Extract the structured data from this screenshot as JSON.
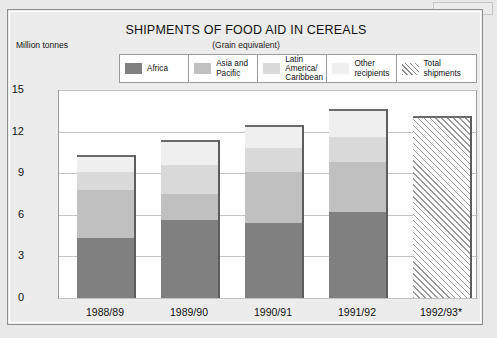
{
  "chart_data": {
    "type": "bar",
    "subtype": "stacked-bar-with-total",
    "title": "SHIPMENTS OF FOOD AID IN CEREALS",
    "subtitle": "(Grain equivalent)",
    "ylabel": "Million tonnes",
    "xlabel": "",
    "ylim": [
      0,
      15
    ],
    "yticks": [
      0,
      3,
      6,
      9,
      12,
      15
    ],
    "grid": true,
    "legend_position": "top",
    "categories": [
      "1988/89",
      "1989/90",
      "1990/91",
      "1991/92",
      "1992/93*"
    ],
    "series": [
      {
        "name": "Africa",
        "color": "#808080",
        "values": [
          4.35,
          5.6,
          5.4,
          6.2,
          null
        ]
      },
      {
        "name": "Asia and Pacific",
        "color": "#c0c0c0",
        "values": [
          3.45,
          1.9,
          3.7,
          3.6,
          null
        ]
      },
      {
        "name": "Latin America/\nCaribbean",
        "color": "#d9d9d9",
        "values": [
          1.3,
          2.1,
          1.75,
          1.8,
          null
        ]
      },
      {
        "name": "Other\nrecipients",
        "color": "#efefef",
        "values": [
          1.2,
          1.8,
          1.65,
          2.0,
          null
        ]
      },
      {
        "name": "Total shipments",
        "color": "hatched",
        "values": [
          null,
          null,
          null,
          null,
          13.1
        ]
      }
    ],
    "totals": [
      10.3,
      11.4,
      12.5,
      13.6,
      13.1
    ]
  },
  "legend": {
    "items": [
      {
        "label": "Africa",
        "swatch": "africa-swatch"
      },
      {
        "label": "Asia and Pacific",
        "swatch": "asia-pacific-swatch"
      },
      {
        "label": "Latin America/\nCaribbean",
        "swatch": "latin-america-swatch"
      },
      {
        "label": "Other\nrecipients",
        "swatch": "other-recipients-swatch"
      },
      {
        "label": "Total shipments",
        "swatch": "total-shipments-hatch-swatch"
      }
    ]
  },
  "axis": {
    "y_labels": [
      "15",
      "12",
      "9",
      "6",
      "3",
      "0"
    ],
    "x_labels": [
      "1988/89",
      "1989/90",
      "1990/91",
      "1991/92",
      "1992/93*"
    ]
  },
  "colors": {
    "africa": "#808080",
    "asia_pacific": "#c0c0c0",
    "latin_america": "#d9d9d9",
    "other_recipients": "#efefef",
    "background": "#ececec",
    "plot_background": "#ffffff",
    "gridline": "#c2c2c2",
    "frame": "#9a9a9a"
  }
}
